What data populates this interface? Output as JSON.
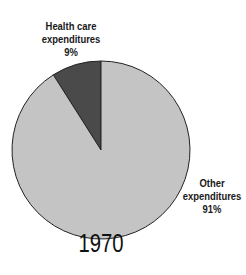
{
  "chart_data": {
    "type": "pie",
    "title": "1970",
    "slices": [
      {
        "label": "Health care expenditures",
        "value": 9,
        "display": "9%",
        "color": "#4a4a4a"
      },
      {
        "label": "Other expenditures",
        "value": 91,
        "display": "91%",
        "color": "#c4c4c4"
      }
    ],
    "legend": "none (direct labels)"
  },
  "labels": {
    "health": {
      "line1": "Health care",
      "line2": "expenditures",
      "pct": "9%"
    },
    "other": {
      "line1": "Other",
      "line2": "expenditures",
      "pct": "91%"
    }
  }
}
